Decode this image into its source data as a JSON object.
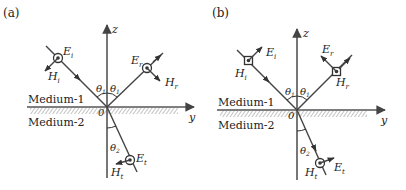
{
  "figure": {
    "panels": [
      {
        "id": "a",
        "label": "(a)",
        "axis_z": "z",
        "axis_y": "y",
        "origin": "0",
        "medium_top": "Medium-1",
        "medium_bottom": "Medium-2",
        "angle_incident": "θ",
        "angle_incident_sub": "1",
        "angle_reflected": "θ",
        "angle_reflected_sub": "1",
        "angle_transmitted": "θ",
        "angle_transmitted_sub": "2",
        "E_incident": "E",
        "E_incident_sub": "i",
        "H_incident": "H",
        "H_incident_sub": "i",
        "E_reflected": "E",
        "E_reflected_sub": "r",
        "H_reflected": "H",
        "H_reflected_sub": "r",
        "E_transmitted": "E",
        "E_transmitted_sub": "t",
        "H_transmitted": "H",
        "H_transmitted_sub": "t",
        "polarization": "E perpendicular to plane of incidence (E out of page)"
      },
      {
        "id": "b",
        "label": "(b)",
        "axis_z": "z",
        "axis_y": "y",
        "origin": "0",
        "medium_top": "Medium-1",
        "medium_bottom": "Medium-2",
        "angle_incident": "θ",
        "angle_incident_sub": "1",
        "angle_reflected": "θ",
        "angle_reflected_sub": "1",
        "angle_transmitted": "θ",
        "angle_transmitted_sub": "2",
        "E_incident": "E",
        "E_incident_sub": "i",
        "H_incident": "H",
        "H_incident_sub": "i",
        "E_reflected": "E",
        "E_reflected_sub": "r",
        "H_reflected": "H",
        "H_reflected_sub": "r",
        "E_transmitted": "E",
        "E_transmitted_sub": "t",
        "H_transmitted": "H",
        "H_transmitted_sub": "t",
        "polarization": "H perpendicular to plane of incidence (H out of page)"
      }
    ],
    "colors": {
      "line": "#444444",
      "text": "#222222",
      "hatch": "#888888",
      "background": "#ffffff"
    }
  }
}
